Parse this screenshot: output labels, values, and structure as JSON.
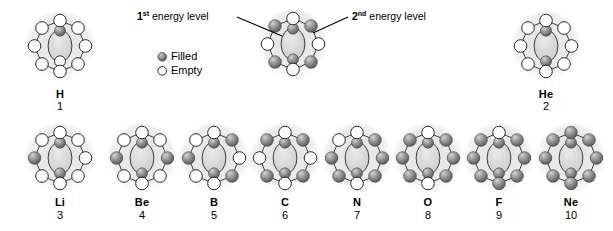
{
  "diagram": {
    "title_hidden": "",
    "colors": {
      "filled_electron": "#8c8c8c",
      "filled_electron_dark": "#5a5a5a",
      "empty_electron_fill": "#ffffff",
      "outline": "#2b2b2b",
      "halo": "#e6e6e6",
      "text": "#000000"
    },
    "callouts": [
      {
        "name": "first-energy-level-callout",
        "prefix": "1",
        "sup": "st",
        "text": " energy level",
        "full": "1st energy level"
      },
      {
        "name": "second-energy-level-callout",
        "prefix": "2",
        "sup": "nd",
        "text": " energy level",
        "full": "2nd energy level"
      }
    ],
    "legend": {
      "name": "electron-legend",
      "items": [
        {
          "glyph": "filled-electron-icon",
          "label": "Filled"
        },
        {
          "glyph": "empty-electron-icon",
          "label": "Empty"
        }
      ]
    },
    "example_atom": {
      "name": "example-atom-carbon",
      "inner_filled": 2,
      "inner_total": 2,
      "outer_filled": 4,
      "outer_total": 8,
      "outer_filled_positions": [
        1,
        3,
        5,
        7
      ]
    },
    "rows": [
      {
        "name": "row-period-one",
        "atoms": [
          {
            "symbol": "H",
            "number": "1",
            "name": "atom-hydrogen",
            "inner_filled": 1,
            "inner_total": 2,
            "outer_filled": 0,
            "outer_total": 8,
            "outer_filled_positions": []
          },
          {
            "symbol": "He",
            "number": "2",
            "name": "atom-helium",
            "inner_filled": 2,
            "inner_total": 2,
            "outer_filled": 0,
            "outer_total": 8,
            "outer_filled_positions": []
          }
        ]
      },
      {
        "name": "row-period-two",
        "atoms": [
          {
            "symbol": "Li",
            "number": "3",
            "name": "atom-lithium",
            "inner_filled": 2,
            "inner_total": 2,
            "outer_filled": 1,
            "outer_total": 8,
            "outer_filled_positions": [
              6
            ]
          },
          {
            "symbol": "Be",
            "number": "4",
            "name": "atom-beryllium",
            "inner_filled": 2,
            "inner_total": 2,
            "outer_filled": 2,
            "outer_total": 8,
            "outer_filled_positions": [
              2,
              6
            ]
          },
          {
            "symbol": "B",
            "number": "5",
            "name": "atom-boron",
            "inner_filled": 2,
            "inner_total": 2,
            "outer_filled": 3,
            "outer_total": 8,
            "outer_filled_positions": [
              1,
              3,
              6
            ]
          },
          {
            "symbol": "C",
            "number": "6",
            "name": "atom-carbon",
            "inner_filled": 2,
            "inner_total": 2,
            "outer_filled": 4,
            "outer_total": 8,
            "outer_filled_positions": [
              1,
              3,
              5,
              7
            ]
          },
          {
            "symbol": "N",
            "number": "7",
            "name": "atom-nitrogen",
            "inner_filled": 2,
            "inner_total": 2,
            "outer_filled": 5,
            "outer_total": 8,
            "outer_filled_positions": [
              1,
              2,
              3,
              5,
              6
            ]
          },
          {
            "symbol": "O",
            "number": "8",
            "name": "atom-oxygen",
            "inner_filled": 2,
            "inner_total": 2,
            "outer_filled": 6,
            "outer_total": 8,
            "outer_filled_positions": [
              1,
              2,
              3,
              5,
              6,
              7
            ]
          },
          {
            "symbol": "F",
            "number": "9",
            "name": "atom-fluorine",
            "inner_filled": 2,
            "inner_total": 2,
            "outer_filled": 7,
            "outer_total": 8,
            "outer_filled_positions": [
              1,
              2,
              3,
              4,
              5,
              6,
              7
            ]
          },
          {
            "symbol": "Ne",
            "number": "10",
            "name": "atom-neon",
            "inner_filled": 2,
            "inner_total": 2,
            "outer_filled": 8,
            "outer_total": 8,
            "outer_filled_positions": [
              0,
              1,
              2,
              3,
              4,
              5,
              6,
              7
            ]
          }
        ]
      }
    ]
  }
}
